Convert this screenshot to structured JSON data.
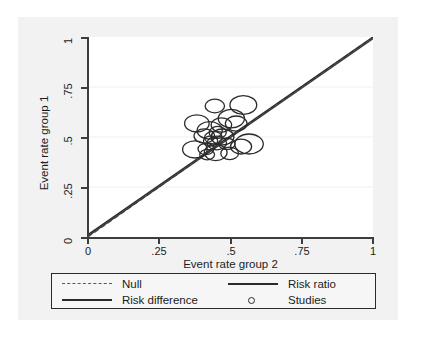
{
  "chart_data": {
    "type": "scatter",
    "title": "",
    "subtitle": "",
    "xlabel": "Event rate group 2",
    "ylabel": "Event rate group 1",
    "xlim": [
      0,
      1
    ],
    "ylim": [
      0,
      1
    ],
    "xticks": [
      "0",
      ".25",
      ".5",
      ".75",
      "1"
    ],
    "xtick_values": [
      0,
      0.25,
      0.5,
      0.75,
      1
    ],
    "yticks": [
      "0",
      ".25",
      ".5",
      ".75",
      "1"
    ],
    "ytick_values": [
      0,
      0.25,
      0.5,
      0.75,
      1
    ],
    "grid": "horizontal-faint",
    "legend_position": "below-plot",
    "marker": "open-circle-bubble",
    "series": [
      {
        "name": "Studies",
        "type": "bubble",
        "marker": "open-circle",
        "color": "#2b2b2b",
        "points": [
          {
            "x": 0.445,
            "y": 0.655,
            "r": 0.034
          },
          {
            "x": 0.545,
            "y": 0.66,
            "r": 0.047
          },
          {
            "x": 0.382,
            "y": 0.568,
            "r": 0.043
          },
          {
            "x": 0.503,
            "y": 0.592,
            "r": 0.046
          },
          {
            "x": 0.468,
            "y": 0.56,
            "r": 0.036
          },
          {
            "x": 0.52,
            "y": 0.567,
            "r": 0.038
          },
          {
            "x": 0.427,
            "y": 0.533,
            "r": 0.044
          },
          {
            "x": 0.455,
            "y": 0.523,
            "r": 0.03
          },
          {
            "x": 0.408,
            "y": 0.505,
            "r": 0.036
          },
          {
            "x": 0.44,
            "y": 0.497,
            "r": 0.031
          },
          {
            "x": 0.472,
            "y": 0.5,
            "r": 0.04
          },
          {
            "x": 0.43,
            "y": 0.48,
            "r": 0.025
          },
          {
            "x": 0.452,
            "y": 0.47,
            "r": 0.034
          },
          {
            "x": 0.487,
            "y": 0.466,
            "r": 0.029
          },
          {
            "x": 0.565,
            "y": 0.465,
            "r": 0.05
          },
          {
            "x": 0.537,
            "y": 0.452,
            "r": 0.037
          },
          {
            "x": 0.375,
            "y": 0.438,
            "r": 0.043
          },
          {
            "x": 0.414,
            "y": 0.44,
            "r": 0.028
          },
          {
            "x": 0.448,
            "y": 0.422,
            "r": 0.04
          },
          {
            "x": 0.497,
            "y": 0.418,
            "r": 0.031
          },
          {
            "x": 0.418,
            "y": 0.412,
            "r": 0.026
          }
        ]
      }
    ],
    "reference_lines": [
      {
        "name": "Null",
        "style": "dashed",
        "color": "#6a6a6a",
        "from": [
          0,
          0
        ],
        "to": [
          1,
          1
        ]
      },
      {
        "name": "Risk ratio",
        "style": "solid",
        "color": "#3a3a3a",
        "from": [
          0,
          0.004
        ],
        "to": [
          1,
          0.992
        ]
      },
      {
        "name": "Risk difference",
        "style": "solid",
        "color": "#2b2b2b",
        "from": [
          0,
          0.012
        ],
        "to": [
          1,
          1.0
        ]
      }
    ],
    "legend_entries": [
      {
        "label": "Null",
        "key": "dashed-line"
      },
      {
        "label": "Risk ratio",
        "key": "solid-line"
      },
      {
        "label": "Risk difference",
        "key": "solid-line"
      },
      {
        "label": "Studies",
        "key": "open-circle"
      }
    ]
  },
  "axes": {
    "y_title": "Event rate group 1",
    "x_title": "Event rate group 2",
    "y_ticks": [
      "1",
      ".75",
      ".5",
      ".25",
      "0"
    ],
    "x_ticks": [
      "0",
      ".25",
      ".5",
      ".75",
      "1"
    ]
  },
  "legend": {
    "null_label": "Null",
    "risk_ratio_label": "Risk ratio",
    "risk_difference_label": "Risk difference",
    "studies_label": "Studies"
  },
  "colors": {
    "figure_background": "#f2f2f2",
    "plot_background": "#ffffff",
    "axis": "#3d3d3d",
    "marker": "#2b2b2b",
    "null_line": "#6a6a6a",
    "legend_border": "#2b2b2b"
  }
}
